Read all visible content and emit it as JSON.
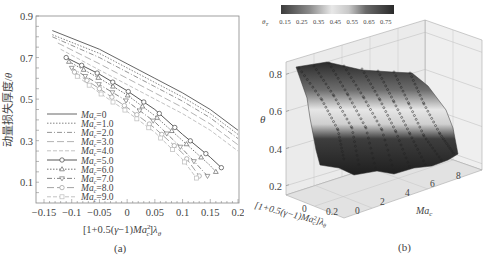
{
  "chart_data": [
    {
      "panel": "(a)",
      "type": "line",
      "title": "",
      "xlabel": "[1+0.5(γ−1)Ma_c²]λ_θ",
      "ylabel": "动量损失厚度/θ",
      "xlim": [
        -0.15,
        0.2
      ],
      "ylim": [
        0.0,
        0.9
      ],
      "xticks": [
        -0.15,
        -0.1,
        -0.05,
        0,
        0.05,
        0.1,
        0.15,
        0.2
      ],
      "xtick_labels": [
        "−0.15",
        "−0.1",
        "−0.05",
        "0",
        "0.05",
        "0.1",
        "0.15",
        "0.2"
      ],
      "yticks": [
        0.1,
        0.3,
        0.5,
        0.7,
        0.9
      ],
      "ytick_labels": [
        "0.1",
        "0.3",
        "0.5",
        "0.7",
        "0.9"
      ],
      "grid": false,
      "legend_position": "lower left",
      "series": [
        {
          "name": "Ma_c=0",
          "style": "solid",
          "marker": "none",
          "color": "#555555",
          "x": [
            -0.135,
            -0.05,
            0.0,
            0.05,
            0.1,
            0.15,
            0.2
          ],
          "y": [
            0.83,
            0.74,
            0.67,
            0.6,
            0.53,
            0.45,
            0.35
          ]
        },
        {
          "name": "Ma_c=1.0",
          "style": "dotted",
          "marker": "none",
          "color": "#777777",
          "x": [
            -0.135,
            -0.05,
            0.0,
            0.05,
            0.1,
            0.15,
            0.2
          ],
          "y": [
            0.81,
            0.72,
            0.65,
            0.58,
            0.51,
            0.43,
            0.33
          ]
        },
        {
          "name": "Ma_c=2.0",
          "style": "dashdot",
          "marker": "none",
          "color": "#888888",
          "x": [
            -0.135,
            -0.05,
            0.0,
            0.05,
            0.1,
            0.15,
            0.2
          ],
          "y": [
            0.8,
            0.7,
            0.63,
            0.56,
            0.49,
            0.41,
            0.31
          ]
        },
        {
          "name": "Ma_c=3.0",
          "style": "longdash",
          "marker": "none",
          "color": "#aaaaaa",
          "x": [
            -0.125,
            -0.05,
            0.0,
            0.05,
            0.1,
            0.15,
            0.2
          ],
          "y": [
            0.77,
            0.67,
            0.6,
            0.53,
            0.46,
            0.38,
            0.28
          ]
        },
        {
          "name": "Ma_c=4.0",
          "style": "dashed",
          "marker": "none",
          "color": "#bbbbbb",
          "x": [
            -0.12,
            -0.05,
            0.0,
            0.05,
            0.1,
            0.15,
            0.2
          ],
          "y": [
            0.74,
            0.64,
            0.57,
            0.5,
            0.43,
            0.35,
            0.25
          ]
        },
        {
          "name": "Ma_c=5.0",
          "style": "solid",
          "marker": "circle",
          "color": "#444444",
          "x": [
            -0.11,
            -0.05,
            0.0,
            0.05,
            0.1,
            0.15,
            0.17
          ],
          "y": [
            0.7,
            0.62,
            0.54,
            0.45,
            0.33,
            0.22,
            0.17
          ]
        },
        {
          "name": "Ma_c=6.0",
          "style": "dotted",
          "marker": "triangle-up",
          "color": "#666666",
          "x": [
            -0.105,
            -0.05,
            0.0,
            0.05,
            0.1,
            0.15,
            0.16
          ],
          "y": [
            0.68,
            0.6,
            0.52,
            0.42,
            0.3,
            0.18,
            0.15
          ]
        },
        {
          "name": "Ma_c=7.0",
          "style": "dashdot",
          "marker": "triangle-down",
          "color": "#777777",
          "x": [
            -0.1,
            -0.05,
            0.0,
            0.05,
            0.1,
            0.145
          ],
          "y": [
            0.65,
            0.57,
            0.49,
            0.39,
            0.26,
            0.13
          ]
        },
        {
          "name": "Ma_c=8.0",
          "style": "longdash",
          "marker": "circle",
          "color": "#999999",
          "x": [
            -0.095,
            -0.05,
            0.0,
            0.05,
            0.1,
            0.13
          ],
          "y": [
            0.63,
            0.55,
            0.46,
            0.36,
            0.24,
            0.13
          ]
        },
        {
          "name": "Ma_c=9.0",
          "style": "dashed",
          "marker": "square",
          "color": "#bbbbbb",
          "x": [
            -0.09,
            -0.05,
            0.0,
            0.05,
            0.1,
            0.125
          ],
          "y": [
            0.61,
            0.53,
            0.44,
            0.34,
            0.21,
            0.12
          ]
        }
      ]
    },
    {
      "panel": "(b)",
      "type": "surface3d",
      "title": "",
      "xlabel": "[1+0.5(γ−1)Ma_c²]λ_θ",
      "ylabel": "Ma_c",
      "zlabel": "θ",
      "x_ticks": [
        "0",
        "0.2"
      ],
      "y_ticks": [
        "0",
        "2",
        "4",
        "6",
        "8"
      ],
      "z_ticks": [
        "0.2",
        "0.4",
        "0.6",
        "0.8"
      ],
      "zlim": [
        0.15,
        0.85
      ],
      "colorbar": {
        "label": "θ_T",
        "ticks": [
          "0.15",
          "0.25",
          "0.35",
          "0.45",
          "0.55",
          "0.65",
          "0.75"
        ],
        "position": "top"
      },
      "surface_summary": {
        "Ma_c_range": [
          0,
          9
        ],
        "theta_max": 0.83,
        "theta_min": 0.12
      }
    }
  ],
  "captions": {
    "a": "(a)",
    "b": "(b)"
  }
}
